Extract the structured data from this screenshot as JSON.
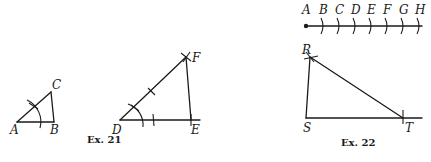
{
  "figures": [
    {
      "id": "ex21",
      "caption": "Ex. 21",
      "triangle_small": {
        "labels": {
          "A": "A",
          "B": "B",
          "C": "C"
        }
      },
      "triangle_large": {
        "labels": {
          "D": "D",
          "E": "E",
          "F": "F"
        }
      }
    },
    {
      "id": "ex22",
      "caption": "Ex. 22",
      "number_line": {
        "labels": [
          "A",
          "B",
          "C",
          "D",
          "E",
          "F",
          "G",
          "H"
        ]
      },
      "triangle": {
        "labels": {
          "R": "R",
          "S": "S",
          "T": "T"
        }
      }
    }
  ]
}
